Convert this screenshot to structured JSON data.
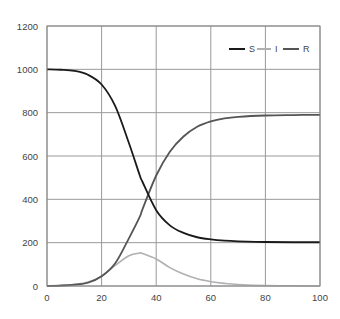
{
  "chart_data": {
    "type": "line",
    "title": "",
    "xlabel": "",
    "ylabel": "",
    "xlim": [
      0,
      100
    ],
    "ylim": [
      0,
      1200
    ],
    "xticks": [
      0,
      20,
      40,
      60,
      80,
      100
    ],
    "yticks": [
      0,
      200,
      400,
      600,
      800,
      1000,
      1200
    ],
    "grid": true,
    "legend_position": "upper right",
    "x": [
      0,
      5,
      10,
      15,
      20,
      25,
      30,
      34,
      35,
      40,
      45,
      50,
      55,
      60,
      65,
      70,
      80,
      90,
      100
    ],
    "series": [
      {
        "name": "S",
        "color": "#1a1a1a",
        "values": [
          1000,
          998,
          993,
          975,
          930,
          830,
          660,
          510,
          480,
          350,
          280,
          245,
          225,
          215,
          209,
          206,
          203,
          202,
          202
        ]
      },
      {
        "name": "I",
        "color": "#b0b0b0",
        "values": [
          1,
          3,
          7,
          18,
          45,
          95,
          140,
          152,
          150,
          125,
          85,
          55,
          33,
          20,
          12,
          7,
          2,
          1,
          0
        ]
      },
      {
        "name": "R",
        "color": "#555555",
        "values": [
          0,
          2,
          6,
          15,
          45,
          105,
          220,
          320,
          355,
          510,
          620,
          690,
          735,
          760,
          774,
          781,
          787,
          789,
          790
        ]
      }
    ]
  },
  "legend": {
    "items": [
      {
        "label": "S",
        "color": "#1a1a1a"
      },
      {
        "label": "I",
        "color": "#b0b0b0"
      },
      {
        "label": "R",
        "color": "#555555"
      }
    ]
  },
  "axes": {
    "x_tick_labels": [
      "0",
      "20",
      "40",
      "60",
      "80",
      "100"
    ],
    "y_tick_labels": [
      "0",
      "200",
      "400",
      "600",
      "800",
      "1000",
      "1200"
    ]
  }
}
